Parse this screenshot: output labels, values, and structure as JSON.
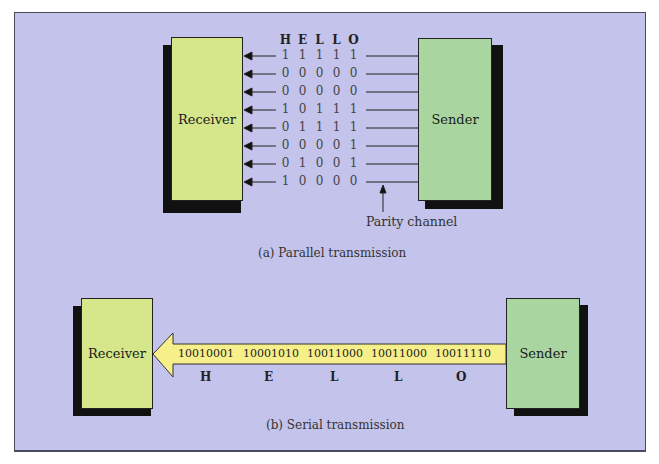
{
  "colors": {
    "background": "#c3c3eb",
    "receiver_fill": "#d6e68a",
    "sender_fill": "#a9d6a0",
    "serial_arrow_fill": "#f7f08a",
    "shadow": "#111111"
  },
  "parallel": {
    "receiver_label": "Receiver",
    "sender_label": "Sender",
    "header_letters": [
      "H",
      "E",
      "L",
      "L",
      "O"
    ],
    "rows": [
      [
        "1",
        "1",
        "1",
        "1",
        "1"
      ],
      [
        "0",
        "0",
        "0",
        "0",
        "0"
      ],
      [
        "0",
        "0",
        "0",
        "0",
        "0"
      ],
      [
        "1",
        "0",
        "1",
        "1",
        "1"
      ],
      [
        "0",
        "1",
        "1",
        "1",
        "1"
      ],
      [
        "0",
        "0",
        "0",
        "0",
        "1"
      ],
      [
        "0",
        "1",
        "0",
        "0",
        "1"
      ],
      [
        "1",
        "0",
        "0",
        "0",
        "0"
      ]
    ],
    "parity_label": "Parity channel",
    "caption": "(a) Parallel transmission"
  },
  "serial": {
    "receiver_label": "Receiver",
    "sender_label": "Sender",
    "bytes": [
      "10010001",
      "10001010",
      "10011000",
      "10011000",
      "10011110"
    ],
    "letters": [
      "H",
      "E",
      "L",
      "L",
      "O"
    ],
    "caption": "(b) Serial transmission"
  }
}
